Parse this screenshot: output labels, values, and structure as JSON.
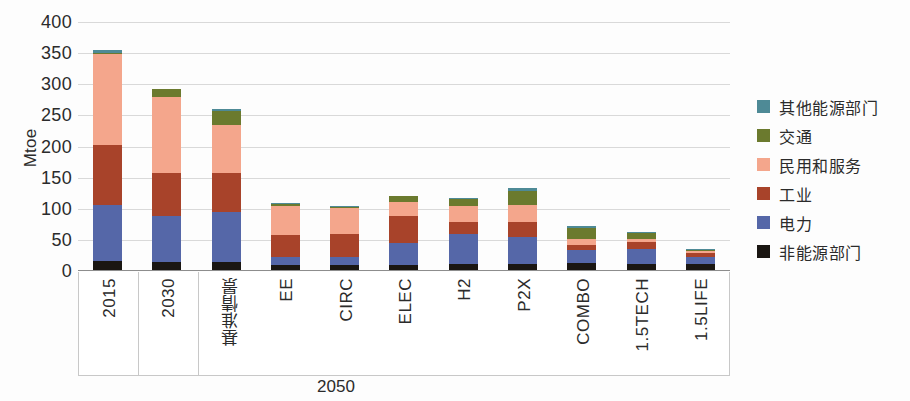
{
  "chart_data": {
    "type": "bar",
    "stacked": true,
    "title": "",
    "subtitle": "",
    "xlabel": "2050",
    "ylabel": "Mtoe",
    "ylim": [
      0,
      400
    ],
    "yticks": [
      400,
      350,
      300,
      250,
      200,
      150,
      100,
      50,
      0
    ],
    "grid": true,
    "legend_position": "right",
    "categories": [
      "2015",
      "2030",
      "基准情景",
      "EE",
      "CIRC",
      "ELEC",
      "H2",
      "P2X",
      "COMBO",
      "1.5TECH",
      "1.5LIFE"
    ],
    "group_label": "2050",
    "group_label_members": [
      "基准情景",
      "EE",
      "CIRC",
      "ELEC",
      "H2",
      "P2X",
      "COMBO",
      "1.5TECH",
      "1.5LIFE"
    ],
    "series": [
      {
        "name": "非能源部门",
        "color": "#1a1612",
        "values": [
          16,
          14,
          14,
          10,
          10,
          10,
          11,
          12,
          13,
          12,
          11
        ]
      },
      {
        "name": "电力",
        "color": "#5567a8",
        "values": [
          90,
          74,
          81,
          12,
          13,
          35,
          48,
          43,
          21,
          24,
          12
        ]
      },
      {
        "name": "工业",
        "color": "#a8432a",
        "values": [
          96,
          69,
          63,
          36,
          37,
          43,
          20,
          23,
          8,
          10,
          6
        ]
      },
      {
        "name": "民用和服务",
        "color": "#f4a68c",
        "values": [
          146,
          123,
          77,
          47,
          41,
          23,
          25,
          28,
          9,
          5,
          3
        ]
      },
      {
        "name": "交通",
        "color": "#6b7a2e",
        "values": [
          2,
          13,
          22,
          2,
          2,
          9,
          11,
          22,
          18,
          10,
          2
        ]
      },
      {
        "name": "其他能源部门",
        "color": "#4e8a96",
        "values": [
          5,
          0,
          3,
          3,
          2,
          1,
          2,
          5,
          3,
          1,
          1
        ]
      }
    ],
    "totals": [
      355,
      293,
      260,
      110,
      105,
      121,
      117,
      133,
      72,
      62,
      35
    ],
    "legend_entries": [
      {
        "label": "其他能源部门",
        "color": "#4e8a96"
      },
      {
        "label": "交通",
        "color": "#6b7a2e"
      },
      {
        "label": "民用和服务",
        "color": "#f4a68c"
      },
      {
        "label": "工业",
        "color": "#a8432a"
      },
      {
        "label": "电力",
        "color": "#5567a8"
      },
      {
        "label": "非能源部门",
        "color": "#1a1612"
      }
    ]
  }
}
